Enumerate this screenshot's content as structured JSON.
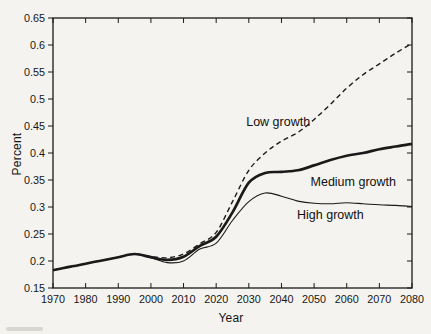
{
  "figure": {
    "background": "#f4f3ef",
    "ink_color": "#1a1a1a"
  },
  "chart_data": {
    "type": "line",
    "title": "",
    "xlabel": "Year",
    "ylabel": "Percent",
    "xlim": [
      1970,
      2080
    ],
    "ylim": [
      0.15,
      0.65
    ],
    "grid": false,
    "legend_position": "inline-annotations",
    "x_ticks": [
      1970,
      1980,
      1990,
      2000,
      2010,
      2020,
      2030,
      2040,
      2050,
      2060,
      2070,
      2080
    ],
    "x_tick_labels": [
      "1970",
      "1980",
      "1990",
      "2000",
      "2010",
      "2020",
      "2030",
      "2040",
      "2050",
      "2060",
      "2070",
      "2080"
    ],
    "y_ticks": [
      0.15,
      0.2,
      0.25,
      0.3,
      0.35,
      0.4,
      0.45,
      0.5,
      0.55,
      0.6,
      0.65
    ],
    "y_tick_labels": [
      "0.15",
      "0.2",
      "0.25",
      "0.3",
      "0.35",
      "0.4",
      "0.45",
      "0.5",
      "0.55",
      "0.6",
      "0.65"
    ],
    "x": [
      1970,
      1975,
      1980,
      1985,
      1990,
      1995,
      2000,
      2005,
      2010,
      2015,
      2020,
      2025,
      2030,
      2035,
      2040,
      2045,
      2050,
      2055,
      2060,
      2065,
      2070,
      2075,
      2080
    ],
    "series": [
      {
        "name": "Low growth",
        "line_style": "dashed",
        "line_width": 1.4,
        "color": "#1a1a1a",
        "values": [
          0.183,
          0.189,
          0.195,
          0.201,
          0.207,
          0.213,
          0.208,
          0.206,
          0.213,
          0.232,
          0.253,
          0.31,
          0.368,
          0.4,
          0.422,
          0.438,
          0.462,
          0.49,
          0.52,
          0.545,
          0.565,
          0.585,
          0.603
        ]
      },
      {
        "name": "Medium growth",
        "line_style": "solid",
        "line_width": 2.7,
        "color": "#1a1a1a",
        "values": [
          0.183,
          0.189,
          0.195,
          0.201,
          0.207,
          0.213,
          0.207,
          0.202,
          0.208,
          0.228,
          0.245,
          0.29,
          0.345,
          0.363,
          0.365,
          0.368,
          0.377,
          0.387,
          0.395,
          0.4,
          0.407,
          0.412,
          0.417
        ]
      },
      {
        "name": "High growth",
        "line_style": "solid",
        "line_width": 1.1,
        "color": "#1a1a1a",
        "values": [
          0.183,
          0.189,
          0.195,
          0.201,
          0.207,
          0.213,
          0.206,
          0.197,
          0.2,
          0.222,
          0.233,
          0.275,
          0.31,
          0.326,
          0.32,
          0.311,
          0.307,
          0.306,
          0.308,
          0.306,
          0.304,
          0.303,
          0.301
        ]
      }
    ],
    "annotations": [
      {
        "label": "Low growth",
        "year": 2039,
        "value": 0.457
      },
      {
        "label": "Medium growth",
        "year": 2062,
        "value": 0.346
      },
      {
        "label": "High growth",
        "year": 2055,
        "value": 0.285
      }
    ]
  }
}
